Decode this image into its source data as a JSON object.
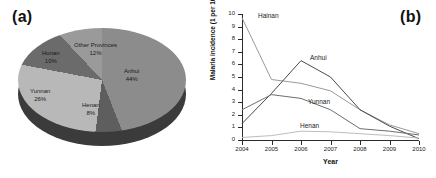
{
  "figure": {
    "panel_a_label": "(a)",
    "panel_b_label": "(b)"
  },
  "chart_data": [
    {
      "type": "pie",
      "panel": "(a)",
      "title": "",
      "labels": [
        "Anhui",
        "Henan",
        "Yunnan",
        "Hunan",
        "Other Provinces"
      ],
      "values": [
        44,
        8,
        26,
        10,
        12
      ],
      "value_suffix": "%",
      "display": "3d-pie",
      "slice_colors": [
        "#8c8c8c",
        "#5e5e5e",
        "#b8b8b8",
        "#6b6b6b",
        "#9a9a9a"
      ],
      "side_color": "#3b3b3b",
      "slices": [
        {
          "label": "Anhui",
          "pct": "44%",
          "value": 44,
          "color": "#8c8c8c"
        },
        {
          "label": "Henan",
          "pct": "8%",
          "value": 8,
          "color": "#5e5e5e"
        },
        {
          "label": "Yunnan",
          "pct": "26%",
          "value": 26,
          "color": "#b8b8b8"
        },
        {
          "label": "Hunan",
          "pct": "10%",
          "value": 10,
          "color": "#6b6b6b"
        },
        {
          "label": "Other Provinces",
          "pct": "12%",
          "value": 12,
          "color": "#9a9a9a"
        }
      ]
    },
    {
      "type": "line",
      "panel": "(b)",
      "title": "",
      "xlabel": "Year",
      "ylabel": "Malaria incidence (1 per 10,000)",
      "x": [
        2004,
        2005,
        2006,
        2007,
        2008,
        2009,
        2010
      ],
      "xtick_labels": [
        "2004",
        "2005",
        "2006",
        "2007",
        "2008",
        "2009",
        "2010"
      ],
      "ytick_labels": [
        "0",
        "1",
        "2",
        "3",
        "4",
        "5",
        "6",
        "7",
        "8",
        "9",
        "10"
      ],
      "ylim": [
        0,
        10
      ],
      "xlim": [
        2004,
        2010
      ],
      "grid": false,
      "legend": "inline-labels",
      "series": [
        {
          "name": "Hainan",
          "values": [
            9.7,
            4.8,
            4.5,
            3.9,
            2.4,
            1.2,
            0.5
          ],
          "color": "#9a9a9a"
        },
        {
          "name": "Anhui",
          "values": [
            1.3,
            3.7,
            6.3,
            5.0,
            2.4,
            1.1,
            0.1
          ],
          "color": "#4a4a4a"
        },
        {
          "name": "Yunnan",
          "values": [
            2.4,
            3.6,
            3.3,
            2.4,
            0.9,
            0.7,
            0.4
          ],
          "color": "#6e6e6e"
        },
        {
          "name": "Henan",
          "values": [
            0.2,
            0.35,
            0.7,
            0.65,
            0.5,
            0.35,
            0.15
          ],
          "color": "#bdbdbd"
        }
      ]
    }
  ]
}
